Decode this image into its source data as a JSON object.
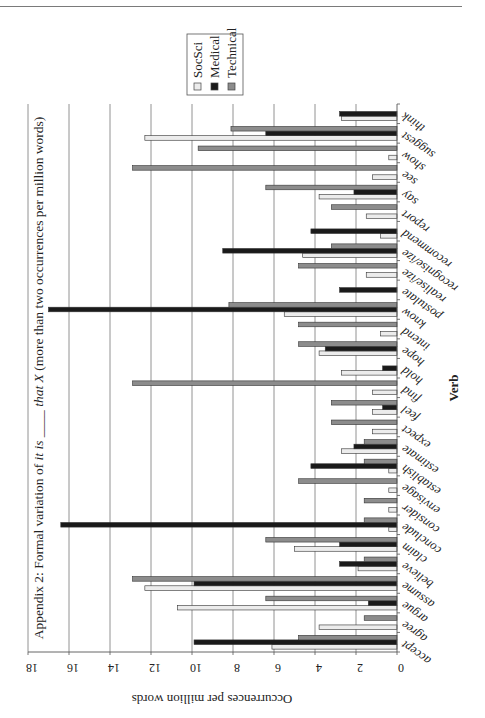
{
  "chart_data": {
    "type": "bar",
    "orientation": "horizontal (page rotated 90° clockwise)",
    "title": "Appendix 2: Formal variation of it is ____ that X (more than two occurrences per million words)",
    "title_parts": {
      "prefix": "Appendix 2: Formal variation of ",
      "italic1": "it is",
      "blank": " ____ ",
      "italic2": "that X",
      "suffix": " (more than two occurrences per million words)"
    },
    "xlabel": "Verb",
    "ylabel": "Occurrences per million words",
    "ylim": [
      0,
      18
    ],
    "yticks": [
      0,
      2,
      4,
      6,
      8,
      10,
      12,
      14,
      16,
      18
    ],
    "grid": true,
    "legend_position": "top-right (rotated)",
    "categories": [
      "accept",
      "agree",
      "argue",
      "assume",
      "believe",
      "claim",
      "conclude",
      "consider",
      "envisage",
      "establish",
      "estimate",
      "expect",
      "feel",
      "find",
      "hold",
      "hope",
      "intend",
      "know",
      "postulate",
      "realise/ize",
      "recognise/ize",
      "recommend",
      "report",
      "say",
      "see",
      "show",
      "suggest",
      "think"
    ],
    "series": [
      {
        "name": "SocSci",
        "color": "#ececec",
        "values": [
          6.1,
          3.8,
          10.7,
          12.3,
          1.9,
          5.0,
          0.4,
          0.4,
          0.4,
          0.4,
          2.7,
          1.2,
          1.2,
          1.2,
          2.7,
          3.8,
          0.8,
          5.5,
          0,
          1.5,
          4.6,
          0.8,
          1.5,
          3.8,
          1.2,
          0.4,
          12.3,
          2.7
        ]
      },
      {
        "name": "Medical",
        "color": "#1a1a1a",
        "values": [
          9.9,
          0,
          1.4,
          9.9,
          2.8,
          2.8,
          16.4,
          0,
          0,
          4.2,
          2.1,
          0,
          0.7,
          0,
          0.7,
          3.5,
          0,
          17.0,
          2.8,
          0,
          8.5,
          4.2,
          0,
          2.1,
          0,
          0,
          6.4,
          2.8
        ]
      },
      {
        "name": "Technical",
        "color": "#8c8c8c",
        "values": [
          4.8,
          1.6,
          6.4,
          12.9,
          1.6,
          6.4,
          1.6,
          1.6,
          4.8,
          1.6,
          1.6,
          3.2,
          3.2,
          12.9,
          0,
          4.8,
          4.8,
          8.2,
          0,
          4.8,
          3.2,
          0,
          3.2,
          6.4,
          12.9,
          9.7,
          8.1,
          0
        ]
      }
    ]
  },
  "legend": {
    "items": [
      {
        "label": "SocSci",
        "color": "#ececec"
      },
      {
        "label": "Medical",
        "color": "#1a1a1a"
      },
      {
        "label": "Technical",
        "color": "#8c8c8c"
      }
    ]
  }
}
